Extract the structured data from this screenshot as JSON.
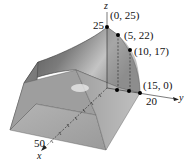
{
  "figure": {
    "axes": {
      "x": {
        "label": "x",
        "tick_label": "50"
      },
      "y": {
        "label": "y",
        "tick_label": "20"
      },
      "z": {
        "label": "z",
        "tick_label": "25"
      }
    },
    "points": [
      {
        "label": "(0, 25)"
      },
      {
        "label": "(5, 22)"
      },
      {
        "label": "(10, 17)"
      },
      {
        "label": "(15, 0)"
      }
    ],
    "colors": {
      "roof_dark": "#5e5e5e",
      "roof_mid": "#8a8a8a",
      "roof_light": "#b8b8b8",
      "front_face": "#a8a8a8",
      "end_face": "#7d7d7d",
      "point": "#000000"
    }
  }
}
